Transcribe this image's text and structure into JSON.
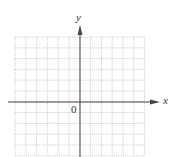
{
  "diagram": {
    "type": "coordinate-grid",
    "axes": {
      "x_label": "x",
      "y_label": "y",
      "origin_label": "0"
    },
    "grid": {
      "columns": 12,
      "rows": 11,
      "cell_px": 10.8,
      "left_px": 15,
      "top_px": 37,
      "line_style": "dotted",
      "line_color": "#b8b8b8"
    },
    "axis_color": "#444444",
    "origin_px": {
      "x": 80,
      "y": 102
    }
  }
}
